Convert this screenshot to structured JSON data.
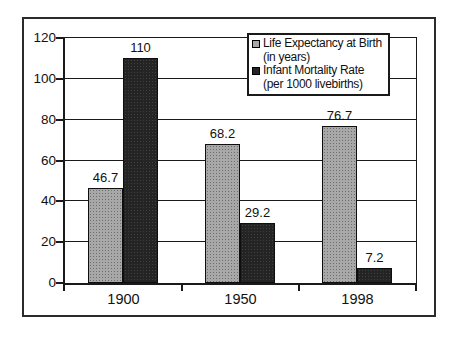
{
  "figure": {
    "background_color": "#ffffff",
    "frame_border_color": "#2b2b2b",
    "axis_color": "#1a1a1a"
  },
  "chart_data": {
    "type": "bar",
    "title": "",
    "xlabel": "",
    "ylabel": "",
    "categories": [
      "1900",
      "1950",
      "1998"
    ],
    "series": [
      {
        "name": "Life Expectancy at Birth (in years)",
        "legend_lines": [
          "Life Expectancy at Birth",
          "(in years)"
        ],
        "color": "#a8a8a8",
        "values": [
          46.7,
          68.2,
          76.7
        ],
        "value_labels": [
          "46.7",
          "68.2",
          "76.7"
        ]
      },
      {
        "name": "Infant Mortality Rate (per 1000 livebirths)",
        "legend_lines": [
          "Infant Mortality Rate",
          "(per 1000 livebirths)"
        ],
        "color": "#242424",
        "values": [
          110,
          29.2,
          7.2
        ],
        "value_labels": [
          "110",
          "29.2",
          "7.2"
        ]
      }
    ],
    "ylim": [
      0,
      120
    ],
    "yticks": [
      0,
      20,
      40,
      60,
      80,
      100,
      120
    ],
    "grid": true,
    "legend_position": "top-right"
  }
}
